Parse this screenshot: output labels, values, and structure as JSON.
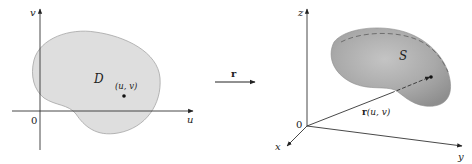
{
  "left_panel": {
    "axis_v_label": "v",
    "axis_u_label": "u",
    "origin_label": "0",
    "region_label": "D",
    "point_label": "(u, v)",
    "region_fill": "#dcdcdc",
    "region_stroke": "#9a9a9a"
  },
  "mapping": {
    "label": "r"
  },
  "right_panel": {
    "axis_z_label": "z",
    "axis_x_label": "x",
    "axis_y_label": "y",
    "origin_label": "0",
    "surface_label": "S",
    "vector_label_func": "r",
    "vector_label_args": "(u, v)",
    "surface_fill": "#a8a8a8",
    "surface_stroke": "#8a8a8a"
  }
}
